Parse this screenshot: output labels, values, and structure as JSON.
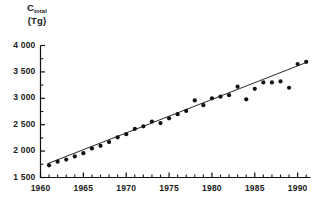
{
  "chart_data": {
    "type": "scatter",
    "title": "",
    "subtitle": "",
    "ylabel_symbol": "C",
    "ylabel_subscript": "total",
    "ylabel_unit": "(Tg)",
    "ylabel_full": "C total (Tg)",
    "xlabel": "",
    "xlim": [
      1960,
      1991.5
    ],
    "ylim": [
      1500,
      4000
    ],
    "grid": false,
    "legend": "none",
    "y_ticks_major": [
      "1 500",
      "2 000",
      "2 500",
      "3 000",
      "3 500",
      "4 000"
    ],
    "y_ticks_major_values": [
      1500,
      2000,
      2500,
      3000,
      3500,
      4000
    ],
    "y_ticks_minor_values": [
      1750,
      2250,
      2750,
      3250,
      3750
    ],
    "x_ticks_major": [
      "1960",
      "1965",
      "1970",
      "1975",
      "1980",
      "1985",
      "1990"
    ],
    "x_ticks_major_values": [
      1960,
      1965,
      1970,
      1975,
      1980,
      1985,
      1990
    ],
    "x_ticks_minor_values": [
      1961,
      1962,
      1963,
      1964,
      1966,
      1967,
      1968,
      1969,
      1971,
      1972,
      1973,
      1974,
      1976,
      1977,
      1978,
      1979,
      1981,
      1982,
      1983,
      1984,
      1986,
      1987,
      1988,
      1989,
      1991
    ],
    "series": [
      {
        "name": "C_total observations",
        "marker": "filled-circle",
        "color": "#111111",
        "x": [
          1961,
          1962,
          1963,
          1964,
          1965,
          1966,
          1967,
          1968,
          1969,
          1970,
          1971,
          1972,
          1973,
          1974,
          1975,
          1976,
          1977,
          1978,
          1979,
          1980,
          1981,
          1982,
          1983,
          1984,
          1985,
          1986,
          1987,
          1988,
          1989,
          1990,
          1991
        ],
        "values": [
          1730,
          1800,
          1840,
          1900,
          1960,
          2050,
          2100,
          2170,
          2260,
          2320,
          2420,
          2470,
          2560,
          2530,
          2620,
          2700,
          2760,
          2960,
          2870,
          3000,
          3030,
          3060,
          3220,
          2980,
          3180,
          3300,
          3300,
          3320,
          3200,
          3650,
          3690
        ]
      }
    ],
    "trend_line": {
      "name": "linear fit",
      "color": "#111111",
      "x_start": 1960.8,
      "x_end": 1991.2,
      "y_start": 1760,
      "y_end": 3690
    }
  },
  "axes": {
    "spine_color": "#111111",
    "tick_color": "#111111",
    "background": "#ffffff"
  }
}
